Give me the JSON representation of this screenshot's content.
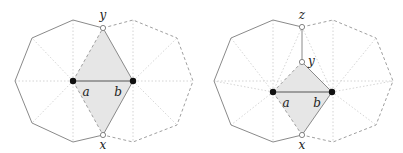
{
  "panels": [
    {
      "id": "left",
      "vertex_labels": {
        "top": "y",
        "bottom": "x",
        "a": "a",
        "b": "b"
      }
    },
    {
      "id": "right",
      "vertex_labels": {
        "top": "z",
        "mid": "y",
        "bottom": "x",
        "a": "a",
        "b": "b"
      }
    }
  ],
  "colors": {
    "solid_edge": "#8a8a8a",
    "dashed_edge": "#a0a0a0",
    "dotted_guide": "#cfcfcf",
    "shaded_region": "#e6e6e6",
    "filled_vertex": "#111111",
    "open_vertex_fill": "#ffffff"
  }
}
